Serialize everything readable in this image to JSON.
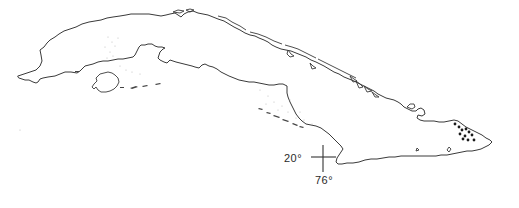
{
  "map": {
    "subject": "Cuba",
    "style": "monochrome outline map",
    "colors": {
      "background": "#ffffff",
      "coastline": "#3a3a3a",
      "locality_marker": "#1a1a1a"
    },
    "reference_mark": {
      "type": "crosshair",
      "latitude_label": "20°",
      "longitude_label": "76°"
    },
    "locality_markers": {
      "shape": "dot",
      "count": 11,
      "region": "eastern Cuba"
    }
  }
}
